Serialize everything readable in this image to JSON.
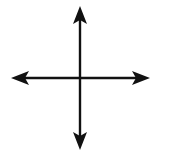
{
  "diagram": {
    "type": "four-way-arrow",
    "stroke_color": "#111111",
    "background": "#ffffff",
    "center": {
      "x": 80,
      "y": 78
    },
    "arrows": [
      {
        "direction": "up",
        "icon": "arrow-up-icon",
        "tip": {
          "x": 80,
          "y": 6
        }
      },
      {
        "direction": "down",
        "icon": "arrow-down-icon",
        "tip": {
          "x": 80,
          "y": 150
        }
      },
      {
        "direction": "left",
        "icon": "arrow-left-icon",
        "tip": {
          "x": 11,
          "y": 78
        }
      },
      {
        "direction": "right",
        "icon": "arrow-right-icon",
        "tip": {
          "x": 150,
          "y": 78
        }
      }
    ]
  }
}
